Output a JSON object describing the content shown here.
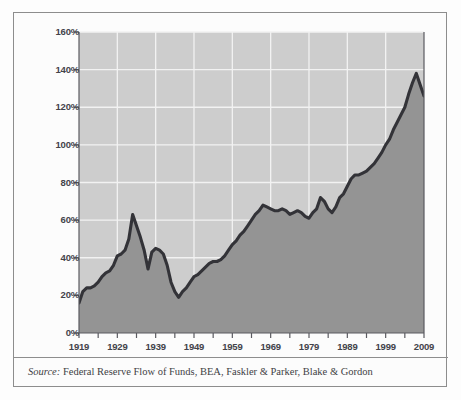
{
  "figure": {
    "source_prefix": "Source:",
    "source_text": " Federal Reserve Flow of Funds, BEA, Faskler & Parker, Blake & Gordon"
  },
  "colors": {
    "plot_background": "#cdcdcd",
    "area_fill": "#949494",
    "line": "#333338",
    "gridline": "#f2f2f2",
    "axis": "#5a5a60",
    "frame": "#8d8d8d",
    "page_background": "#fcfcfc",
    "tick_label": "#43434a"
  },
  "chart_data": {
    "type": "area",
    "title": "",
    "subtitle": "",
    "xlabel": "",
    "ylabel": "",
    "xlim": [
      1919,
      2009
    ],
    "ylim": [
      0,
      160
    ],
    "grid": true,
    "legend": null,
    "y_ticks": [
      0,
      20,
      40,
      60,
      80,
      100,
      120,
      140,
      160
    ],
    "y_tick_labels": [
      "0%",
      "20%",
      "40%",
      "60%",
      "80%",
      "100%",
      "120%",
      "140%",
      "160%"
    ],
    "x_tick_labels": [
      "1919",
      "1929",
      "1939",
      "1949",
      "1959",
      "1969",
      "1979",
      "1989",
      "1999",
      "2009"
    ],
    "x_tick_values": [
      1919,
      1929,
      1939,
      1949,
      1959,
      1969,
      1979,
      1989,
      1999,
      2009
    ],
    "x_minor_ticks": [
      1924,
      1934,
      1944,
      1954,
      1964,
      1974,
      1984,
      1994,
      2004
    ],
    "series": [
      {
        "name": "Total debt as percent of GDP",
        "x": [
          1919,
          1920,
          1921,
          1922,
          1923,
          1924,
          1925,
          1926,
          1927,
          1928,
          1929,
          1930,
          1931,
          1932,
          1933,
          1934,
          1935,
          1936,
          1937,
          1938,
          1939,
          1940,
          1941,
          1942,
          1943,
          1944,
          1945,
          1946,
          1947,
          1948,
          1949,
          1950,
          1951,
          1952,
          1953,
          1954,
          1955,
          1956,
          1957,
          1958,
          1959,
          1960,
          1961,
          1962,
          1963,
          1964,
          1965,
          1966,
          1967,
          1968,
          1969,
          1970,
          1971,
          1972,
          1973,
          1974,
          1975,
          1976,
          1977,
          1978,
          1979,
          1980,
          1981,
          1982,
          1983,
          1984,
          1985,
          1986,
          1987,
          1988,
          1989,
          1990,
          1991,
          1992,
          1993,
          1994,
          1995,
          1996,
          1997,
          1998,
          1999,
          2000,
          2001,
          2002,
          2003,
          2004,
          2005,
          2006,
          2007,
          2008,
          2009
        ],
        "y": [
          16,
          22,
          24,
          24,
          25,
          27,
          30,
          32,
          33,
          36,
          41,
          42,
          44,
          50,
          63,
          57,
          51,
          44,
          34,
          43,
          45,
          44,
          42,
          36,
          27,
          22,
          19,
          22,
          24,
          27,
          30,
          31,
          33,
          35,
          37,
          38,
          38,
          39,
          41,
          44,
          47,
          49,
          52,
          54,
          57,
          60,
          63,
          65,
          68,
          67,
          66,
          65,
          65,
          66,
          65,
          63,
          64,
          65,
          64,
          62,
          61,
          64,
          66,
          72,
          70,
          66,
          64,
          67,
          72,
          74,
          78,
          82,
          84,
          84,
          85,
          86,
          88,
          90,
          93,
          96,
          100,
          103,
          108,
          112,
          116,
          120,
          127,
          133,
          138,
          132,
          126
        ]
      }
    ],
    "annotations": []
  }
}
